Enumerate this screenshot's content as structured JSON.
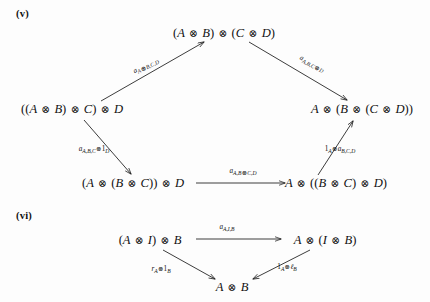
{
  "page": {
    "background": "#fdfdfd",
    "ink": "#1a1a1a",
    "width": 430,
    "height": 302
  },
  "diagrams": [
    {
      "marker": "(v)",
      "name": "pentagon-axiom",
      "nodes": [
        {
          "id": "top",
          "text": "(A ⊗ B) ⊗ (C ⊗ D)",
          "x": 224,
          "y": 33
        },
        {
          "id": "left",
          "text": "((A ⊗ B) ⊗ C) ⊗ D",
          "x": 72,
          "y": 109
        },
        {
          "id": "right",
          "text": "A ⊗ (B ⊗ (C ⊗ D))",
          "x": 362,
          "y": 109
        },
        {
          "id": "bottom-left",
          "text": "(A ⊗ (B ⊗ C)) ⊗ D",
          "x": 133,
          "y": 183
        },
        {
          "id": "bottom-right",
          "text": "A ⊗ ((B ⊗ C) ⊗ D)",
          "x": 336,
          "y": 183
        }
      ],
      "arrows": [
        {
          "id": "left-to-top",
          "label": "a_{A⊗B,C,D}",
          "label_html": "a<sub>A<span class=\"op\">⊗</span>B,C,D</sub>",
          "from": "left",
          "to": "top",
          "label_x": 146,
          "label_y": 66,
          "rotate": -26
        },
        {
          "id": "top-to-right",
          "label": "a_{A,B,C⊗D}",
          "label_html": "a<sub>A,B,C<span class=\"op\">⊗</span>D</sub>",
          "from": "top",
          "to": "right",
          "label_x": 312,
          "label_y": 64,
          "rotate": 27
        },
        {
          "id": "left-to-bottom-left",
          "label": "a_{A,B,C} ⊗ 1_D",
          "label_html": "a<sub>A,B,C</sub><span class=\"op\">⊗</span><span class=\"num\">1</span><sub>D</sub>",
          "from": "left",
          "to": "bottom-left",
          "label_x": 94,
          "label_y": 150,
          "rotate": 0
        },
        {
          "id": "bottom-left-to-right",
          "label": "a_{A,B⊗C,D}",
          "label_html": "a<sub>A,B<span class=\"op\">⊗</span>C,D</sub>",
          "from": "bottom-left",
          "to": "bottom-right",
          "label_x": 243,
          "label_y": 172,
          "rotate": 0
        },
        {
          "id": "bottom-right-to-right",
          "label": "1_A ⊗ a_{B,C,D}",
          "label_html": "<span class=\"num\">1</span><sub>A</sub><span class=\"op\">⊗</span>a<sub>B,C,D</sub>",
          "from": "bottom-right",
          "to": "right",
          "label_x": 340,
          "label_y": 150,
          "rotate": 0
        }
      ]
    },
    {
      "marker": "(vi)",
      "name": "triangle-axiom",
      "nodes": [
        {
          "id": "tri-left",
          "text": "(A ⊗ I) ⊗ B",
          "x": 150,
          "y": 240
        },
        {
          "id": "tri-right",
          "text": "A ⊗ (I ⊗ B)",
          "x": 325,
          "y": 240
        },
        {
          "id": "tri-bottom",
          "text": "A ⊗ B",
          "x": 232,
          "y": 287
        }
      ],
      "arrows": [
        {
          "id": "tri-top",
          "label": "a_{A,I,B}",
          "label_html": "a<sub>A,I,B</sub>",
          "from": "tri-left",
          "to": "tri-right",
          "label_x": 227,
          "label_y": 228,
          "rotate": 0
        },
        {
          "id": "tri-left-down",
          "label": "r_A ⊗ 1_B",
          "label_html": "r<sub>A</sub><span class=\"op\">⊗</span><span class=\"num\">1</span><sub>B</sub>",
          "from": "tri-left",
          "to": "tri-bottom",
          "label_x": 161,
          "label_y": 270,
          "rotate": 0
        },
        {
          "id": "tri-right-down",
          "label": "1_A ⊗ ℓ_B",
          "label_html": "<span class=\"num\">1</span><sub>A</sub><span class=\"op\">⊗</span>ℓ<sub>B</sub>",
          "from": "tri-right",
          "to": "tri-bottom",
          "label_x": 287,
          "label_y": 268,
          "rotate": 0
        }
      ]
    }
  ]
}
